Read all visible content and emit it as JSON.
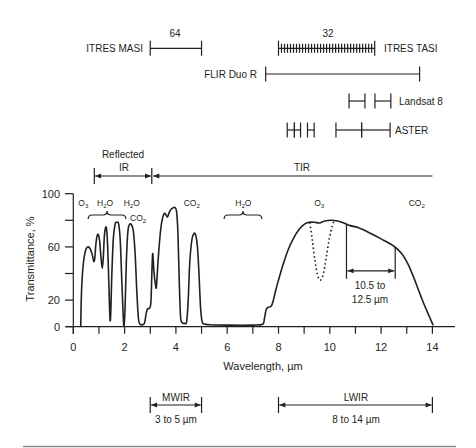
{
  "chart_data": {
    "type": "line",
    "title": "",
    "xlabel": "Wavelength, µm",
    "ylabel": "Transmittance, %",
    "xlim": [
      0,
      14
    ],
    "ylim": [
      0,
      100
    ],
    "grid": false,
    "x_ticks": [
      0,
      1,
      2,
      3,
      4,
      5,
      6,
      7,
      8,
      9,
      10,
      11,
      12,
      13,
      14
    ],
    "x_tick_labels": [
      {
        "value": 0,
        "label": "0"
      },
      {
        "value": 2,
        "label": "2"
      },
      {
        "value": 4,
        "label": "4"
      },
      {
        "value": 6,
        "label": "6"
      },
      {
        "value": 8,
        "label": "8"
      },
      {
        "value": 10,
        "label": "10"
      },
      {
        "value": 12,
        "label": "12"
      },
      {
        "value": 14,
        "label": "14"
      }
    ],
    "y_ticks": [
      0,
      20,
      40,
      60,
      80,
      100
    ],
    "y_tick_labels": [
      {
        "value": 0,
        "label": "0"
      },
      {
        "value": 20,
        "label": "20"
      },
      {
        "value": 60,
        "label": "60"
      },
      {
        "value": 100,
        "label": "100"
      }
    ],
    "series": [
      {
        "name": "Atmospheric transmittance",
        "style": "solid",
        "points": [
          [
            0.29,
            0
          ],
          [
            0.31,
            20
          ],
          [
            0.35,
            38
          ],
          [
            0.42,
            52
          ],
          [
            0.5,
            58.5
          ],
          [
            0.58,
            60
          ],
          [
            0.66,
            58.5
          ],
          [
            0.74,
            54
          ],
          [
            0.8,
            49
          ],
          [
            0.84,
            52
          ],
          [
            0.88,
            62
          ],
          [
            0.93,
            68.5
          ],
          [
            0.98,
            69
          ],
          [
            1.03,
            64
          ],
          [
            1.08,
            52
          ],
          [
            1.13,
            44
          ],
          [
            1.17,
            52
          ],
          [
            1.21,
            68
          ],
          [
            1.26,
            74.5
          ],
          [
            1.3,
            73
          ],
          [
            1.34,
            60
          ],
          [
            1.39,
            30
          ],
          [
            1.43,
            6
          ],
          [
            1.46,
            10
          ],
          [
            1.5,
            38
          ],
          [
            1.56,
            66
          ],
          [
            1.63,
            77
          ],
          [
            1.7,
            78.5
          ],
          [
            1.77,
            77
          ],
          [
            1.83,
            65
          ],
          [
            1.89,
            35
          ],
          [
            1.95,
            6
          ],
          [
            1.98,
            1
          ],
          [
            2.02,
            15
          ],
          [
            2.07,
            50
          ],
          [
            2.13,
            72
          ],
          [
            2.2,
            77
          ],
          [
            2.27,
            76.5
          ],
          [
            2.34,
            72
          ],
          [
            2.41,
            55
          ],
          [
            2.48,
            25
          ],
          [
            2.54,
            6
          ],
          [
            2.6,
            2
          ],
          [
            2.7,
            1.5
          ],
          [
            2.78,
            3
          ],
          [
            2.84,
            10
          ],
          [
            2.9,
            13.5
          ],
          [
            2.98,
            14
          ],
          [
            3.03,
            20
          ],
          [
            3.07,
            45
          ],
          [
            3.1,
            55
          ],
          [
            3.14,
            42
          ],
          [
            3.2,
            32
          ],
          [
            3.24,
            30
          ],
          [
            3.3,
            48
          ],
          [
            3.38,
            68
          ],
          [
            3.46,
            80
          ],
          [
            3.54,
            85
          ],
          [
            3.6,
            84.5
          ],
          [
            3.67,
            82.5
          ],
          [
            3.74,
            86
          ],
          [
            3.82,
            88.5
          ],
          [
            3.9,
            89.5
          ],
          [
            3.97,
            89.5
          ],
          [
            4.03,
            86
          ],
          [
            4.08,
            70
          ],
          [
            4.13,
            35
          ],
          [
            4.18,
            8
          ],
          [
            4.24,
            3
          ],
          [
            4.34,
            2.5
          ],
          [
            4.42,
            4
          ],
          [
            4.48,
            20
          ],
          [
            4.54,
            48
          ],
          [
            4.62,
            65
          ],
          [
            4.7,
            70
          ],
          [
            4.77,
            69
          ],
          [
            4.84,
            60
          ],
          [
            4.9,
            40
          ],
          [
            4.96,
            15
          ],
          [
            5.02,
            4
          ],
          [
            5.1,
            2
          ],
          [
            5.3,
            1.5
          ],
          [
            6.0,
            1.2
          ],
          [
            7.0,
            1.2
          ],
          [
            7.38,
            1.8
          ],
          [
            7.45,
            6
          ],
          [
            7.52,
            13
          ],
          [
            7.6,
            14.5
          ],
          [
            7.72,
            15.5
          ],
          [
            7.8,
            20
          ],
          [
            7.9,
            28
          ],
          [
            8.0,
            35
          ],
          [
            8.2,
            48
          ],
          [
            8.4,
            59
          ],
          [
            8.6,
            67
          ],
          [
            8.8,
            73
          ],
          [
            9.0,
            77
          ],
          [
            9.2,
            78.5
          ],
          [
            9.4,
            78.5
          ],
          [
            9.6,
            78
          ],
          [
            9.8,
            79.5
          ],
          [
            10.05,
            80
          ],
          [
            10.3,
            79.5
          ],
          [
            10.55,
            78
          ],
          [
            10.8,
            76
          ],
          [
            11.1,
            74.5
          ],
          [
            11.5,
            71
          ],
          [
            12.0,
            66
          ],
          [
            12.5,
            60.5
          ],
          [
            12.8,
            55
          ],
          [
            13.05,
            47
          ],
          [
            13.25,
            38
          ],
          [
            13.45,
            28
          ],
          [
            13.65,
            18
          ],
          [
            13.85,
            9
          ],
          [
            14.03,
            1
          ]
        ]
      },
      {
        "name": "O3 absorption band",
        "style": "dotted",
        "points": [
          [
            9.22,
            78.3
          ],
          [
            9.32,
            65
          ],
          [
            9.42,
            50
          ],
          [
            9.52,
            39
          ],
          [
            9.62,
            35
          ],
          [
            9.74,
            39
          ],
          [
            9.86,
            52
          ],
          [
            9.98,
            66
          ],
          [
            10.1,
            76
          ],
          [
            10.18,
            79.8
          ]
        ]
      }
    ],
    "absorption_labels": [
      {
        "parts": [
          [
            "O",
            false
          ],
          [
            "3",
            true
          ]
        ],
        "x_um": 0.39,
        "row": 0
      },
      {
        "parts": [
          [
            "H",
            false
          ],
          [
            "2",
            true
          ],
          [
            "O",
            false
          ]
        ],
        "x_um": 1.24,
        "row": 0
      },
      {
        "parts": [
          [
            "H",
            false
          ],
          [
            "2",
            true
          ],
          [
            "O",
            false
          ]
        ],
        "x_um": 2.28,
        "row": 0
      },
      {
        "parts": [
          [
            "CO",
            false
          ],
          [
            "2",
            true
          ]
        ],
        "x_um": 2.53,
        "row": 1
      },
      {
        "parts": [
          [
            "CO",
            false
          ],
          [
            "2",
            true
          ]
        ],
        "x_um": 4.62,
        "row": 0
      },
      {
        "parts": [
          [
            "H",
            false
          ],
          [
            "2",
            true
          ],
          [
            "O",
            false
          ]
        ],
        "x_um": 6.63,
        "row": 0
      },
      {
        "parts": [
          [
            "O",
            false
          ],
          [
            "3",
            true
          ]
        ],
        "x_um": 9.59,
        "row": 0
      },
      {
        "parts": [
          [
            "CO",
            false
          ],
          [
            "2",
            true
          ]
        ],
        "x_um": 13.39,
        "row": 0
      }
    ],
    "absorption_braces": [
      {
        "range_um": [
          0.58,
          2.05
        ]
      },
      {
        "range_um": [
          5.88,
          7.35
        ]
      }
    ],
    "bandwidth_annotation": {
      "label_line1": "10.5 to",
      "label_line2": "12.5 µm",
      "range_um": [
        10.5,
        12.5
      ],
      "drawn_at_um": [
        10.65,
        12.55
      ]
    },
    "spectral_regions": [
      {
        "name": "Reflected IR",
        "label_line1": "Reflected",
        "label_line2": "IR",
        "range_um": [
          0.82,
          3.06
        ]
      },
      {
        "name": "TIR",
        "label_line1": "TIR",
        "range_um": [
          3.06,
          14.0
        ]
      },
      {
        "name": "MWIR",
        "label_line1": "MWIR",
        "label_line2": "3 to 5 µm",
        "range_um": [
          3,
          5
        ]
      },
      {
        "name": "LWIR",
        "label_line1": "LWIR",
        "label_line2": "8 to 14 µm",
        "range_um": [
          8,
          14
        ]
      }
    ],
    "instruments": [
      {
        "name": "ITRES MASI",
        "channels": "64",
        "bands_um": [
          [
            3.0,
            5.0
          ]
        ],
        "hatched": false
      },
      {
        "name": "ITRES TASI",
        "channels": "32",
        "bands_um": [
          [
            8.0,
            11.75
          ]
        ],
        "hatched": true,
        "hatch_count": 32
      },
      {
        "name": "FLIR Duo R",
        "bands_um": [
          [
            7.5,
            13.5
          ]
        ],
        "hatched": false
      },
      {
        "name": "Landsat 8",
        "bands_um": [
          [
            10.75,
            11.37
          ],
          [
            11.76,
            12.38
          ]
        ],
        "hatched": false
      },
      {
        "name": "ASTER",
        "bands_um": [
          [
            8.34,
            8.62
          ],
          [
            8.62,
            8.86
          ],
          [
            9.13,
            9.39
          ],
          [
            10.24,
            11.24
          ],
          [
            11.24,
            12.35
          ]
        ],
        "hatched": false
      }
    ]
  }
}
